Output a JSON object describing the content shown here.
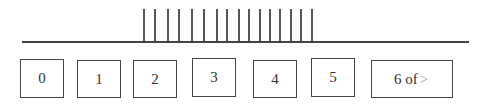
{
  "timeline": {
    "tick_count": 16,
    "tick_positions_x": [
      143,
      154,
      167,
      178,
      191,
      203,
      216,
      226,
      238,
      248,
      259,
      269,
      279,
      290,
      300,
      311
    ]
  },
  "pages": [
    {
      "label": "0",
      "x": 20,
      "y": 59,
      "w": 44,
      "h": 39
    },
    {
      "label": "1",
      "x": 77,
      "y": 60,
      "w": 44,
      "h": 38
    },
    {
      "label": "2",
      "x": 133,
      "y": 60,
      "w": 44,
      "h": 38
    },
    {
      "label": "3",
      "x": 192,
      "y": 58,
      "w": 44,
      "h": 39
    },
    {
      "label": "4",
      "x": 253,
      "y": 60,
      "w": 44,
      "h": 38
    },
    {
      "label": "5",
      "x": 311,
      "y": 58,
      "w": 44,
      "h": 39
    }
  ],
  "more": {
    "label": "6 of",
    "arrow": ">",
    "x": 371,
    "y": 60,
    "w": 82,
    "h": 38
  }
}
